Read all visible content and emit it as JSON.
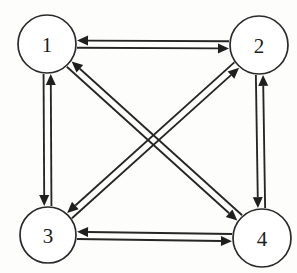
{
  "figure": {
    "type": "directed-graph",
    "background_color": "#fdfdfc",
    "stroke_color": "#262626",
    "node_fill_color": "#ffffff",
    "arrow_color": "#1f1f1f",
    "canvas": {
      "width": 297,
      "height": 273
    }
  },
  "nodes": [
    {
      "id": "1",
      "label": "1",
      "cx": 47,
      "cy": 44,
      "r": 29
    },
    {
      "id": "2",
      "label": "2",
      "cx": 259,
      "cy": 45,
      "r": 29
    },
    {
      "id": "3",
      "label": "3",
      "cx": 48,
      "cy": 235,
      "r": 28
    },
    {
      "id": "4",
      "label": "4",
      "cx": 262,
      "cy": 238,
      "r": 29
    }
  ],
  "edges": [
    {
      "id": "e-1-2",
      "from": "1",
      "to": "2",
      "bidirectional": true,
      "kind": "side-top"
    },
    {
      "id": "e-1-3",
      "from": "1",
      "to": "3",
      "bidirectional": true,
      "kind": "side-left"
    },
    {
      "id": "e-2-4",
      "from": "2",
      "to": "4",
      "bidirectional": true,
      "kind": "side-right"
    },
    {
      "id": "e-3-4",
      "from": "3",
      "to": "4",
      "bidirectional": true,
      "kind": "side-bottom"
    },
    {
      "id": "e-1-4",
      "from": "1",
      "to": "4",
      "bidirectional": true,
      "kind": "diagonal"
    },
    {
      "id": "e-2-3",
      "from": "2",
      "to": "3",
      "bidirectional": true,
      "kind": "diagonal"
    }
  ],
  "arrows": [
    {
      "id": "a-1-to-2",
      "from": "1",
      "to": "2"
    },
    {
      "id": "a-2-to-1",
      "from": "2",
      "to": "1"
    },
    {
      "id": "a-1-to-3",
      "from": "1",
      "to": "3"
    },
    {
      "id": "a-3-to-1",
      "from": "3",
      "to": "1"
    },
    {
      "id": "a-2-to-4",
      "from": "2",
      "to": "4"
    },
    {
      "id": "a-4-to-2",
      "from": "4",
      "to": "2"
    },
    {
      "id": "a-3-to-4",
      "from": "3",
      "to": "4"
    },
    {
      "id": "a-4-to-3",
      "from": "4",
      "to": "3"
    },
    {
      "id": "a-1-to-4",
      "from": "1",
      "to": "4"
    },
    {
      "id": "a-4-to-1",
      "from": "4",
      "to": "1"
    },
    {
      "id": "a-2-to-3",
      "from": "2",
      "to": "3"
    },
    {
      "id": "a-3-to-2",
      "from": "3",
      "to": "2"
    }
  ]
}
